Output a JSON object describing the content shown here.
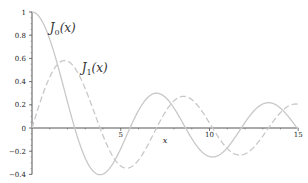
{
  "chart_data": {
    "type": "line",
    "title": "",
    "xlabel": "x",
    "ylabel": "",
    "xlim": [
      0,
      15
    ],
    "ylim": [
      -0.4,
      1
    ],
    "grid": false,
    "x_ticks": [
      "5",
      "10",
      "15"
    ],
    "y_ticks": [
      "1",
      "0.8",
      "0.6",
      "0.4",
      "0.2",
      "0",
      "-0.2",
      "-0.4"
    ],
    "series": [
      {
        "name": "J0(x)",
        "label_main": "J",
        "label_sub": "0",
        "label_arg": "(x)",
        "style": "solid",
        "color": "#c8c8c8",
        "x": [
          0,
          0.5,
          1,
          1.5,
          2,
          2.5,
          3,
          3.5,
          4,
          4.5,
          5,
          5.5,
          6,
          6.5,
          7,
          7.5,
          8,
          8.5,
          9,
          9.5,
          10,
          10.5,
          11,
          11.5,
          12,
          12.5,
          13,
          13.5,
          14,
          14.5,
          15
        ],
        "values": [
          1,
          0.938,
          0.765,
          0.512,
          0.224,
          -0.048,
          -0.26,
          -0.38,
          -0.397,
          -0.321,
          -0.178,
          -0.007,
          0.151,
          0.26,
          0.3,
          0.266,
          0.172,
          0.042,
          -0.09,
          -0.194,
          -0.246,
          -0.237,
          -0.171,
          -0.068,
          0.048,
          0.147,
          0.207,
          0.215,
          0.171,
          0.088,
          -0.014
        ]
      },
      {
        "name": "J1(x)",
        "label_main": "J",
        "label_sub": "1",
        "label_arg": "(x)",
        "style": "dashed",
        "color": "#c8c8c8",
        "x": [
          0,
          0.5,
          1,
          1.5,
          2,
          2.5,
          3,
          3.5,
          4,
          4.5,
          5,
          5.5,
          6,
          6.5,
          7,
          7.5,
          8,
          8.5,
          9,
          9.5,
          10,
          10.5,
          11,
          11.5,
          12,
          12.5,
          13,
          13.5,
          14,
          14.5,
          15
        ],
        "values": [
          0,
          0.242,
          0.44,
          0.558,
          0.577,
          0.497,
          0.339,
          0.137,
          -0.066,
          -0.231,
          -0.328,
          -0.341,
          -0.277,
          -0.154,
          -0.005,
          0.135,
          0.235,
          0.273,
          0.245,
          0.161,
          0.043,
          -0.079,
          -0.177,
          -0.228,
          -0.223,
          -0.166,
          -0.07,
          0.038,
          0.133,
          0.193,
          0.205
        ]
      }
    ],
    "annotations": [
      {
        "text": "J0(x)",
        "x": 1.0,
        "y": 0.83
      },
      {
        "text": "J1(x)",
        "x": 2.8,
        "y": 0.48
      }
    ]
  }
}
